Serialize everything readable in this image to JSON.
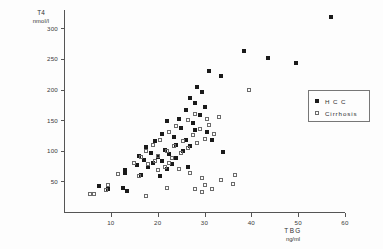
{
  "chart_data": {
    "type": "scatter",
    "title": "",
    "xlabel": "TBG",
    "xunit": "ng/ml",
    "ylabel": "T4",
    "yunit": "nmol/l",
    "xlim": [
      0,
      60
    ],
    "ylim": [
      0,
      330
    ],
    "xticks": [
      10,
      20,
      30,
      40,
      50,
      60
    ],
    "yticks": [
      50,
      100,
      150,
      200,
      250,
      300
    ],
    "grid": false,
    "legend_position": "right",
    "series": [
      {
        "name": "HCC",
        "marker": "filled-square",
        "color": "#1a1a1a",
        "points": [
          [
            57.0,
            318
          ],
          [
            49.5,
            243
          ],
          [
            43.5,
            252
          ],
          [
            38.5,
            263
          ],
          [
            33.5,
            222
          ],
          [
            31.0,
            231
          ],
          [
            28.5,
            205
          ],
          [
            29.5,
            196
          ],
          [
            27.0,
            186
          ],
          [
            28.0,
            178
          ],
          [
            30.0,
            172
          ],
          [
            26.0,
            166
          ],
          [
            29.0,
            158
          ],
          [
            24.5,
            152
          ],
          [
            27.5,
            145
          ],
          [
            22.0,
            148
          ],
          [
            25.0,
            138
          ],
          [
            28.0,
            134
          ],
          [
            30.5,
            130
          ],
          [
            21.0,
            128
          ],
          [
            23.5,
            122
          ],
          [
            26.0,
            118
          ],
          [
            19.5,
            116
          ],
          [
            24.0,
            110
          ],
          [
            27.0,
            108
          ],
          [
            17.5,
            106
          ],
          [
            21.5,
            102
          ],
          [
            25.5,
            100
          ],
          [
            18.5,
            97
          ],
          [
            22.5,
            94
          ],
          [
            16.0,
            92
          ],
          [
            20.0,
            90
          ],
          [
            24.0,
            88
          ],
          [
            17.0,
            85
          ],
          [
            21.0,
            83
          ],
          [
            19.0,
            80
          ],
          [
            23.0,
            78
          ],
          [
            15.5,
            76
          ],
          [
            18.0,
            73
          ],
          [
            22.0,
            71
          ],
          [
            13.0,
            68
          ],
          [
            13.0,
            63
          ],
          [
            16.5,
            60
          ],
          [
            20.5,
            58
          ],
          [
            12.5,
            40
          ],
          [
            7.5,
            42
          ],
          [
            9.5,
            38
          ],
          [
            13.5,
            34
          ],
          [
            31.5,
            118
          ],
          [
            34.0,
            98
          ],
          [
            26.5,
            74
          ]
        ]
      },
      {
        "name": "Cirrhosis",
        "marker": "open-square",
        "color": "#6a6a6a",
        "points": [
          [
            39.5,
            200
          ],
          [
            33.0,
            156
          ],
          [
            30.5,
            152
          ],
          [
            28.0,
            160
          ],
          [
            31.0,
            142
          ],
          [
            26.5,
            150
          ],
          [
            29.0,
            136
          ],
          [
            32.0,
            128
          ],
          [
            24.0,
            140
          ],
          [
            27.5,
            126
          ],
          [
            30.0,
            120
          ],
          [
            22.5,
            130
          ],
          [
            25.5,
            116
          ],
          [
            28.5,
            112
          ],
          [
            20.5,
            118
          ],
          [
            23.5,
            108
          ],
          [
            26.5,
            104
          ],
          [
            19.0,
            110
          ],
          [
            22.0,
            100
          ],
          [
            25.0,
            96
          ],
          [
            17.5,
            100
          ],
          [
            20.0,
            92
          ],
          [
            23.0,
            88
          ],
          [
            16.5,
            90
          ],
          [
            19.5,
            84
          ],
          [
            22.5,
            80
          ],
          [
            18.0,
            78
          ],
          [
            21.5,
            74
          ],
          [
            15.0,
            80
          ],
          [
            20.0,
            68
          ],
          [
            24.5,
            70
          ],
          [
            27.0,
            64
          ],
          [
            11.5,
            62
          ],
          [
            16.0,
            58
          ],
          [
            29.5,
            56
          ],
          [
            33.5,
            52
          ],
          [
            36.0,
            46
          ],
          [
            30.0,
            44
          ],
          [
            31.5,
            38
          ],
          [
            9.0,
            36
          ],
          [
            9.5,
            44
          ],
          [
            5.5,
            30
          ],
          [
            6.5,
            30
          ],
          [
            17.5,
            26
          ],
          [
            28.0,
            38
          ],
          [
            29.5,
            32
          ],
          [
            36.5,
            60
          ],
          [
            22.0,
            40
          ]
        ]
      }
    ]
  },
  "legend": {
    "items": [
      {
        "label": "H C C",
        "marker": "filled"
      },
      {
        "label": "Cirrhosis",
        "marker": "open"
      }
    ]
  }
}
